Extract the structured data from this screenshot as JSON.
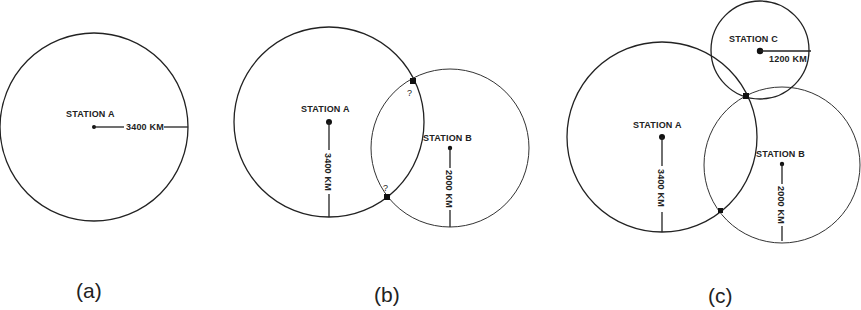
{
  "figure": {
    "panels": [
      {
        "id": "a",
        "label": "(a)",
        "stations": [
          {
            "name": "STATION A",
            "radius_label": "3400 KM",
            "radius_km": 3400
          }
        ]
      },
      {
        "id": "b",
        "label": "(b)",
        "stations": [
          {
            "name": "STATION A",
            "radius_label": "3400 KM",
            "radius_km": 3400
          },
          {
            "name": "STATION B",
            "radius_label": "2000 KM",
            "radius_km": 2000
          }
        ],
        "intersection_marks": [
          "?",
          "?"
        ]
      },
      {
        "id": "c",
        "label": "(c)",
        "stations": [
          {
            "name": "STATION A",
            "radius_label": "3400 KM",
            "radius_km": 3400
          },
          {
            "name": "STATION B",
            "radius_label": "2000 KM",
            "radius_km": 2000
          },
          {
            "name": "STATION C",
            "radius_label": "1200 KM",
            "radius_km": 1200
          }
        ]
      }
    ],
    "colors": {
      "line": "#222222",
      "background": "#ffffff"
    }
  }
}
